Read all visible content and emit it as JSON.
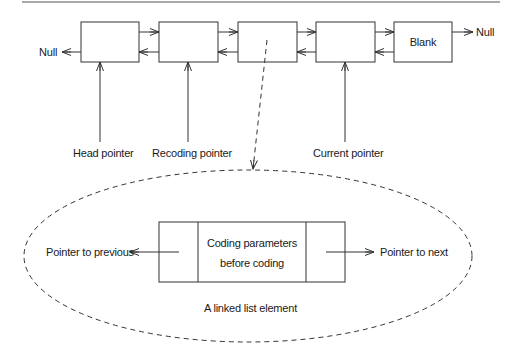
{
  "diagram": {
    "nodes": [
      {
        "id": "node-1",
        "label": ""
      },
      {
        "id": "node-2",
        "label": ""
      },
      {
        "id": "node-3",
        "label": ""
      },
      {
        "id": "node-4",
        "label": ""
      },
      {
        "id": "node-5",
        "label": "Blank"
      }
    ],
    "null_left": "Null",
    "null_right": "Null",
    "pointers": {
      "head": "Head pointer",
      "recoding": "Recoding pointer",
      "current": "Current pointer"
    },
    "element": {
      "content_line1": "Coding parameters",
      "content_line2": "before coding",
      "prev_label": "Pointer to previous",
      "next_label": "Pointer to next",
      "caption": "A linked list element"
    }
  }
}
